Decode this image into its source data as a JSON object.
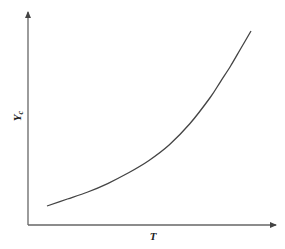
{
  "chart_data": {
    "type": "line",
    "title": "",
    "xlabel": "T",
    "ylabel": "Y_c",
    "ylabel_main": "Y",
    "ylabel_sub": "c",
    "grid": false,
    "legend": null,
    "ticks": false,
    "series": [
      {
        "name": "Y_c",
        "x": [
          0.0,
          0.1,
          0.2,
          0.3,
          0.4,
          0.5,
          0.6,
          0.7,
          0.8,
          0.85,
          0.9,
          0.95,
          1.0
        ],
        "values": [
          0.0,
          0.04,
          0.08,
          0.13,
          0.19,
          0.26,
          0.35,
          0.47,
          0.62,
          0.71,
          0.8,
          0.9,
          1.0
        ]
      }
    ],
    "xlim": [
      0,
      1
    ],
    "ylim": [
      0,
      1
    ],
    "colors": {
      "axis": "#555555",
      "curve": "#444444"
    }
  }
}
